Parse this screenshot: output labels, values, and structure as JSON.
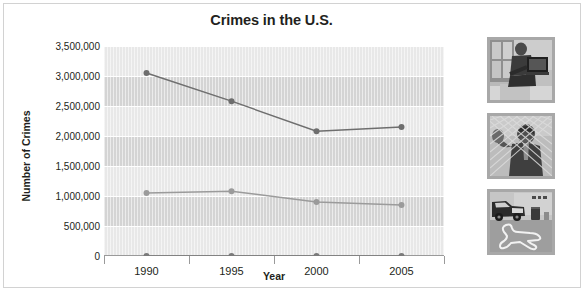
{
  "chart_data": {
    "type": "line",
    "title": "Crimes in the U.S.",
    "xlabel": "Year",
    "ylabel": "Number of Crimes",
    "categories": [
      "1990",
      "1995",
      "2000",
      "2005"
    ],
    "ylim": [
      0,
      3500000
    ],
    "ytick_values": [
      0,
      500000,
      1000000,
      1500000,
      2000000,
      2500000,
      3000000,
      3500000
    ],
    "ytick_labels": [
      "0",
      "500,000",
      "1,000,000",
      "1,500,000",
      "2,000,000",
      "2,500,000",
      "3,000,000",
      "3,500,000"
    ],
    "grid": true,
    "legend": "none",
    "series": [
      {
        "name": "series-1",
        "color": "#6e6e6e",
        "marker": "circle",
        "values": [
          3050000,
          2580000,
          2080000,
          2150000
        ]
      },
      {
        "name": "series-2",
        "color": "#9b9b9b",
        "marker": "circle",
        "values": [
          1050000,
          1080000,
          900000,
          850000
        ]
      },
      {
        "name": "series-3",
        "color": "#7a7a7a",
        "marker": "circle",
        "values": [
          0,
          0,
          0,
          0
        ]
      }
    ],
    "plot_background": "#e8e8e8",
    "band_color": "#d4d4d4",
    "gridline_color": "#ffffff"
  },
  "photos": [
    {
      "name": "photo-burglar-with-television",
      "alt": "person carrying a television away from a window"
    },
    {
      "name": "photo-person-behind-chain-link-fence",
      "alt": "person behind a chain link fence raising a hand"
    },
    {
      "name": "photo-crime-scene-body-outline",
      "alt": "crime scene with police car and chalk body outline"
    }
  ]
}
